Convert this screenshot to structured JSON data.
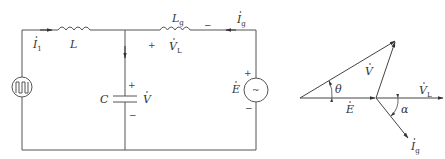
{
  "circuit": {
    "inverter_source": {
      "label": "",
      "symbol": "square-wave"
    },
    "inductor_L": {
      "label": "L"
    },
    "inductor_Lg": {
      "label": "L",
      "sub": "g"
    },
    "capacitor": {
      "label": "C"
    },
    "grid_source": {
      "label": "E",
      "symbol": "~",
      "plus": "+",
      "minus": "−"
    },
    "current_i1": {
      "label": "I",
      "sub": "1"
    },
    "current_ig": {
      "label": "I",
      "sub": "g"
    },
    "voltage_V": {
      "label": "V",
      "plus": "+",
      "minus": "−"
    },
    "voltage_VL": {
      "label": "V",
      "sub": "L",
      "plus": "+",
      "minus": "−"
    }
  },
  "phasor": {
    "V": {
      "label": "V"
    },
    "E": {
      "label": "E"
    },
    "VL": {
      "label": "V",
      "sub": "L"
    },
    "Ig": {
      "label": "I",
      "sub": "g"
    },
    "theta": {
      "label": "θ"
    },
    "alpha": {
      "label": "α"
    }
  }
}
